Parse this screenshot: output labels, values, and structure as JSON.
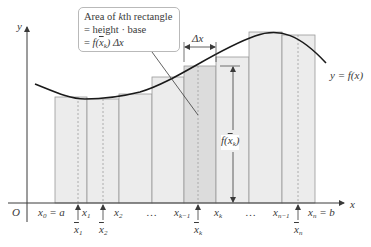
{
  "diagram": {
    "axes": {
      "origin_label": "O",
      "x_axis_label": "x",
      "y_axis_label": "y"
    },
    "curve_label": "y = f(x)",
    "callout": {
      "line1_prefix": "Area of ",
      "line1_k": "k",
      "line1_suffix": "th rectangle",
      "line2": "= height · base",
      "line3_eq": "= ",
      "line3_f": "f(",
      "line3_xbar": "x",
      "line3_sub": "k",
      "line3_close": ")",
      "line3_dx": " Δx"
    },
    "delta_x_label": "Δx",
    "height_label": {
      "f": "f(",
      "xbar": "x",
      "sub": "k",
      "close": ")"
    },
    "partition_labels": [
      {
        "text": "x",
        "sub": "0",
        "suffix": " = a"
      },
      {
        "text": "x",
        "sub": "1",
        "suffix": ""
      },
      {
        "text": "x",
        "sub": "2",
        "suffix": ""
      },
      {
        "text": "…",
        "sub": "",
        "suffix": ""
      },
      {
        "text": "x",
        "sub": "k−1",
        "suffix": ""
      },
      {
        "text": "x",
        "sub": "k",
        "suffix": ""
      },
      {
        "text": "…",
        "sub": "",
        "suffix": ""
      },
      {
        "text": "x",
        "sub": "n−1",
        "suffix": ""
      },
      {
        "text": "x",
        "sub": "n",
        "suffix": " = b"
      }
    ],
    "sample_point_labels": [
      {
        "text": "x",
        "sub": "1"
      },
      {
        "text": "x",
        "sub": "2"
      },
      {
        "text": "x",
        "sub": "k"
      },
      {
        "text": "x",
        "sub": "n"
      }
    ],
    "colors": {
      "rect_fill": "#ececec",
      "rect_highlight_fill": "#dcdcdc",
      "rect_stroke": "#9a9a9a",
      "curve": "#1a1a1a",
      "axis": "#3a3a3a",
      "text": "#3a3a3a"
    }
  }
}
